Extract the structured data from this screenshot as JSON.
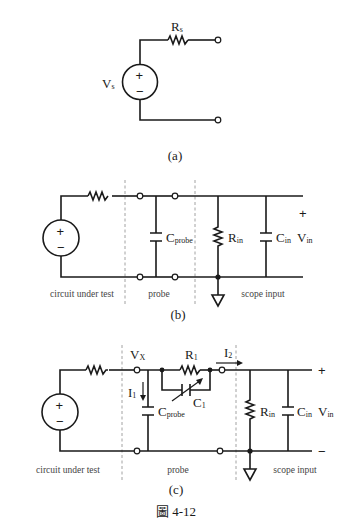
{
  "figure": {
    "caption": "圖 4-12",
    "panels": [
      {
        "id": "a",
        "label": "(a)",
        "source": {
          "name": "V",
          "sub": "s",
          "plus": "+",
          "minus": "−"
        },
        "resistor": {
          "name": "R",
          "sub": "s"
        }
      },
      {
        "id": "b",
        "label": "(b)",
        "source": {
          "name": "V",
          "sub": "s",
          "plus": "+",
          "minus": "−"
        },
        "resistor_rs": {
          "name": "R",
          "sub": "s"
        },
        "cap_probe": {
          "name": "C",
          "sub": "probe"
        },
        "res_in": {
          "name": "R",
          "sub": "in"
        },
        "cap_in": {
          "name": "C",
          "sub": "in"
        },
        "vin": {
          "name": "V",
          "sub": "in",
          "plus": "+"
        },
        "regions": [
          "circuit under test",
          "probe",
          "scope input"
        ]
      },
      {
        "id": "c",
        "label": "(c)",
        "source": {
          "name": "V",
          "sub": "s",
          "plus": "+",
          "minus": "−"
        },
        "resistor_rs": {
          "name": "R",
          "sub": "s"
        },
        "node_vx": {
          "name": "V",
          "sub": "X"
        },
        "res_r1": {
          "name": "R",
          "sub": "1"
        },
        "cap_c1": {
          "name": "C",
          "sub": "1"
        },
        "current_i1": {
          "name": "I",
          "sub": "1"
        },
        "current_i2": {
          "name": "I",
          "sub": "2"
        },
        "cap_probe": {
          "name": "C",
          "sub": "probe"
        },
        "res_in": {
          "name": "R",
          "sub": "in"
        },
        "cap_in": {
          "name": "C",
          "sub": "in"
        },
        "vin": {
          "name": "V",
          "sub": "in",
          "plus": "+",
          "minus": "−"
        },
        "regions": [
          "circuit under test",
          "probe",
          "scope input"
        ]
      }
    ]
  }
}
